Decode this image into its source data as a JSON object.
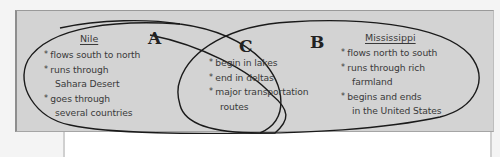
{
  "diagram": {
    "type": "venn",
    "sets": {
      "A": {
        "letter": "A",
        "title": "Nile",
        "items": [
          {
            "text": "flows south to north",
            "lines": [
              "flows south to north"
            ]
          },
          {
            "text": "runs through Sahara Desert",
            "lines": [
              "runs through",
              "Sahara Desert"
            ]
          },
          {
            "text": "goes through several countries",
            "lines": [
              "goes through",
              "several countries"
            ]
          }
        ]
      },
      "B": {
        "letter": "B",
        "title": "Mississippi",
        "items": [
          {
            "text": "flows north to south",
            "lines": [
              "flows north to south"
            ]
          },
          {
            "text": "runs through rich farmland",
            "lines": [
              "runs through rich",
              "farmland"
            ]
          },
          {
            "text": "begins and ends in the United States",
            "lines": [
              "begins and ends",
              "in the United States"
            ]
          }
        ]
      },
      "C": {
        "letter": "C",
        "title": "",
        "items": [
          {
            "text": "begin in lakes",
            "lines": [
              "begin in lakes"
            ]
          },
          {
            "text": "end in deltas",
            "lines": [
              "end in deltas"
            ]
          },
          {
            "text": "major transportation routes",
            "lines": [
              "major transportation",
              "routes"
            ]
          }
        ]
      }
    },
    "colors": {
      "panel": "#d3d3d3",
      "outline": "#1a1a1a",
      "text": "#3a3a3a",
      "page": "#ffffff"
    }
  }
}
